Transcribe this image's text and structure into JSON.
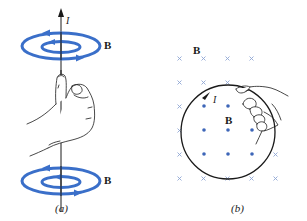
{
  "figure": {
    "panel_a": {
      "caption": "(a)",
      "current_label": "I",
      "field_label_top": "B",
      "field_label_bottom": "B",
      "description": "Right-hand rule: thumb points along current I in a straight wire; fingers curl in direction of magnetic field B loops"
    },
    "panel_b": {
      "caption": "(b)",
      "field_label_outside": "B",
      "field_label_inside": "B",
      "current_label": "I",
      "description": "Current loop: field into page (x) outside loop, out of page (dots) inside loop; right hand curls fingers along current"
    },
    "colors": {
      "field_blue": "#3a6fc9",
      "ink": "#1a1a1a",
      "cross_blue": "#8fa6d4",
      "dot_blue": "#3e66b8"
    }
  }
}
